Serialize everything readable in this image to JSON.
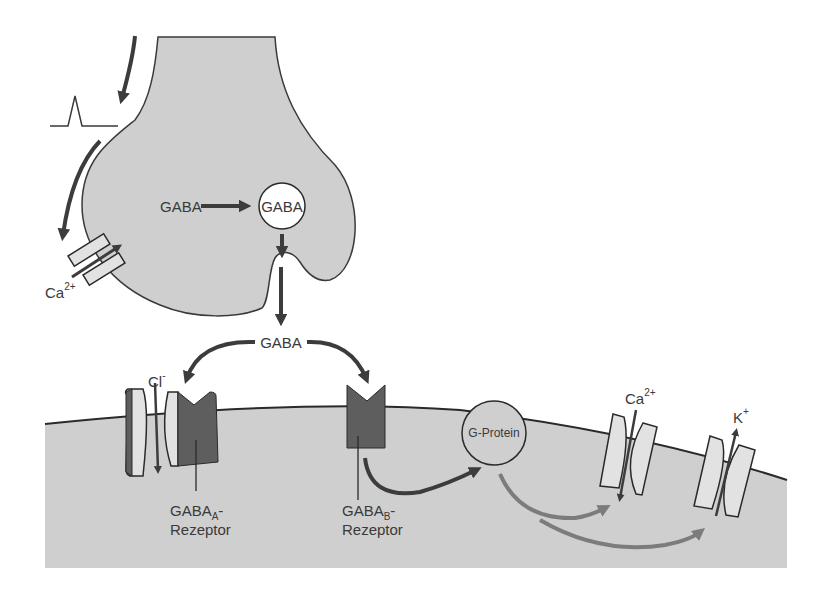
{
  "diagram": {
    "colors": {
      "cell_fill": "#cfcfcf",
      "outline": "#3a3a3a",
      "receptor_dark": "#5e5e5e",
      "channel_light": "#e2e2e2",
      "arrow_dark": "#3c3c3c",
      "arrow_gray": "#7c7c7c",
      "background": "#ffffff"
    },
    "presynaptic": {
      "action_potential_icon": "spike-icon",
      "calcium_channel_label": "Ca",
      "calcium_channel_charge": "2+",
      "gaba_source_label": "GABA",
      "vesicle_label": "GABA"
    },
    "synaptic_cleft": {
      "released_label": "GABA"
    },
    "postsynaptic": {
      "gaba_a": {
        "ion_label": "Cl",
        "ion_charge": "-",
        "receptor_name": "GABA",
        "receptor_subscript": "A",
        "receptor_suffix": "-",
        "receptor_line2": "Rezeptor"
      },
      "gaba_b": {
        "receptor_name": "GABA",
        "receptor_subscript": "B",
        "receptor_suffix": "-",
        "receptor_line2": "Rezeptor"
      },
      "g_protein_label": "G-Protein",
      "calcium_channel": {
        "ion_label": "Ca",
        "ion_charge": "2+"
      },
      "potassium_channel": {
        "ion_label": "K",
        "ion_charge": "+"
      }
    }
  }
}
